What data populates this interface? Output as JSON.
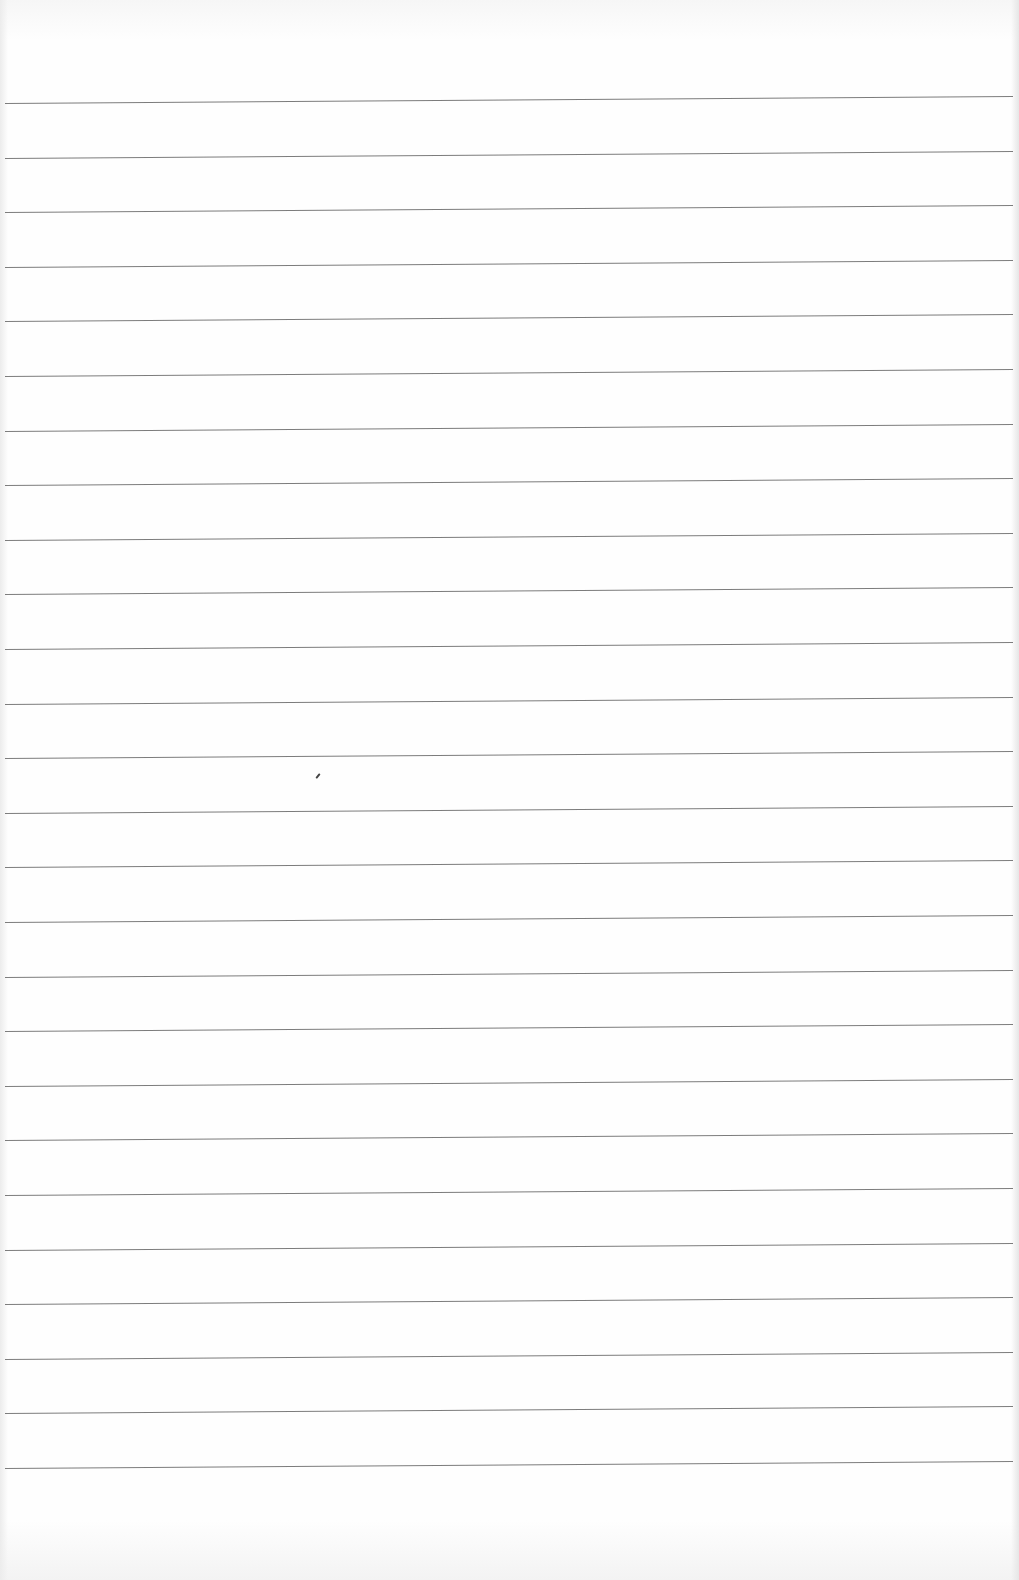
{
  "document": {
    "type": "blank ruled sheet",
    "text": "",
    "rules": {
      "count": 26,
      "first_left_y": 103,
      "first_right_y": 96,
      "spacing_px": 54.6,
      "x_start": 5,
      "x_end": 1013,
      "color": "#6e6e6e"
    },
    "marks": [
      {
        "name": "pencil-speck",
        "x": 317,
        "y": 773
      }
    ],
    "background_color": "#fdfdfd"
  }
}
